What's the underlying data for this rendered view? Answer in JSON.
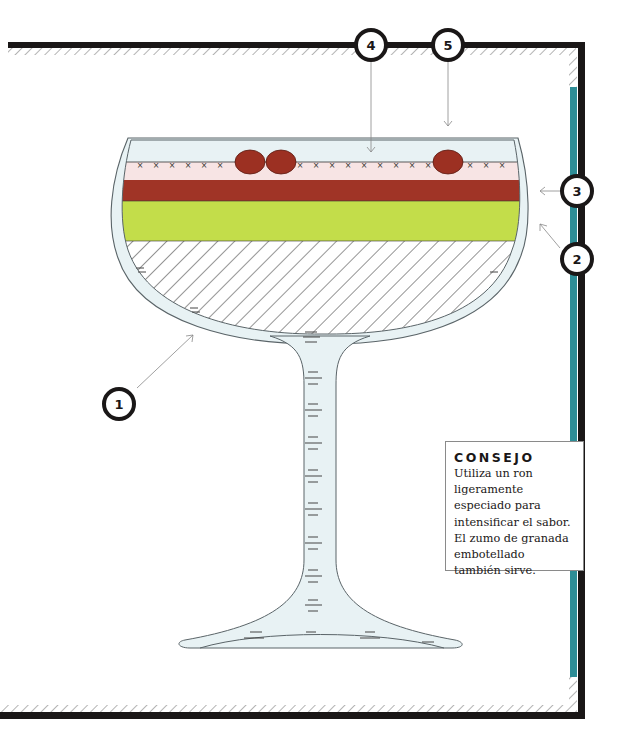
{
  "diagram": {
    "type": "cocktail-glass-layer-diagram",
    "glass": "coupe",
    "colors": {
      "frame": "#1a1717",
      "frame_accent": "#2e8d96",
      "glass_fill": "#e8f2f4",
      "glass_outline": "#5a6468",
      "garnish": "#9c3022",
      "top_layer": "#f7e4e4",
      "red_layer": "#a03426",
      "green_layer": "#c3dd4a",
      "hatch": "#2b2b2b"
    },
    "layers_top_to_bottom": [
      "garnish-berries",
      "pink-foam-layer",
      "red-layer",
      "green-layer",
      "hatched-base-layer"
    ],
    "callouts": [
      {
        "id": "1",
        "label": "1",
        "points_to": "glass bowl"
      },
      {
        "id": "2",
        "label": "2",
        "points_to": "green layer"
      },
      {
        "id": "3",
        "label": "3",
        "points_to": "red layer"
      },
      {
        "id": "4",
        "label": "4",
        "points_to": "top foam layer / garnish"
      },
      {
        "id": "5",
        "label": "5",
        "points_to": "top of glass"
      }
    ]
  },
  "tip": {
    "title": "CONSEJO",
    "body": "Utiliza un ron ligeramente especiado para intensificar el sabor. El zumo de granada embotellado también sirve."
  }
}
